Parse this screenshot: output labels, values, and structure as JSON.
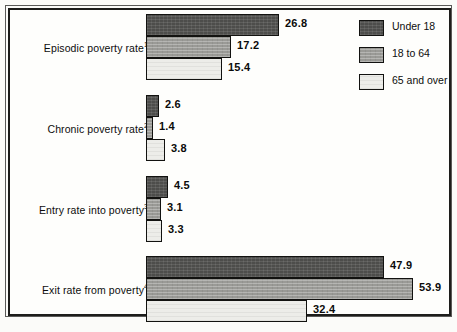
{
  "chart_data": {
    "type": "bar",
    "orientation": "horizontal",
    "title": "",
    "xlabel": "",
    "ylabel": "",
    "xlim": [
      0,
      58
    ],
    "grid": false,
    "legend_position": "top-right",
    "categories": [
      "Episodic poverty rate",
      "Chronic poverty rate",
      "Entry rate into poverty",
      "Exit rate from poverty"
    ],
    "category_footnotes": [
      "1",
      "2",
      "3",
      "4"
    ],
    "series": [
      {
        "name": "Under 18",
        "color": "#4d4d4b",
        "values": [
          26.8,
          2.6,
          4.5,
          47.9
        ]
      },
      {
        "name": "18 to 64",
        "color": "#a2a29e",
        "values": [
          17.2,
          1.4,
          3.1,
          53.9
        ]
      },
      {
        "name": "65 and over",
        "color": "#edede9",
        "values": [
          15.4,
          3.8,
          3.3,
          32.4
        ]
      }
    ],
    "value_labels": [
      [
        "26.8",
        "17.2",
        "15.4"
      ],
      [
        "2.6",
        "1.4",
        "3.8"
      ],
      [
        "4.5",
        "3.1",
        "3.3"
      ],
      [
        "47.9",
        "53.9",
        "32.4"
      ]
    ]
  },
  "legend": {
    "items": [
      {
        "label": "Under 18",
        "swatch": "dark-swatch-icon"
      },
      {
        "label": "18 to 64",
        "swatch": "medium-swatch-icon"
      },
      {
        "label": "65 and over",
        "swatch": "light-swatch-icon"
      }
    ]
  }
}
